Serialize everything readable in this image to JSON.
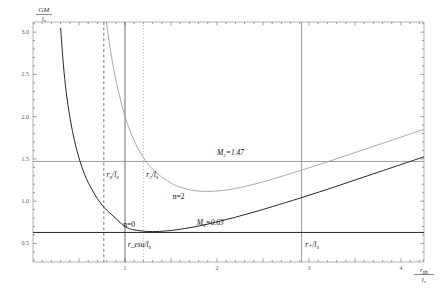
{
  "chart_data": {
    "type": "line",
    "title": "",
    "xlabel": "r_ph/l_0",
    "ylabel": "GM/l_0",
    "xlim": [
      0,
      4.25
    ],
    "ylim": [
      0.28,
      3.12
    ],
    "xticks": [
      0.5,
      1,
      1.5,
      2,
      2.5,
      3,
      3.5,
      4
    ],
    "xticklabels": [
      "",
      "1",
      "",
      "2",
      "",
      "3",
      "",
      "4"
    ],
    "yticks": [
      0.5,
      1.0,
      1.5,
      2.0,
      2.5,
      3.0
    ],
    "yticklabels": [
      "0.5",
      "1.0",
      "1.5",
      "2.0",
      "2.5",
      "3.0"
    ],
    "grid": false,
    "legend_position": "inline-annotations",
    "series": [
      {
        "name": "n=0",
        "color": "#262626",
        "style": "solid",
        "label": "n=0",
        "minimum": {
          "x": 1.0,
          "y": 0.63
        },
        "points": [
          [
            0.3,
            3.05
          ],
          [
            0.33,
            2.62
          ],
          [
            0.36,
            2.3
          ],
          [
            0.4,
            2.0
          ],
          [
            0.44,
            1.77
          ],
          [
            0.48,
            1.59
          ],
          [
            0.52,
            1.44
          ],
          [
            0.56,
            1.32
          ],
          [
            0.6,
            1.22
          ],
          [
            0.65,
            1.12
          ],
          [
            0.7,
            1.03
          ],
          [
            0.75,
            0.955
          ],
          [
            0.8,
            0.895
          ],
          [
            0.85,
            0.845
          ],
          [
            0.9,
            0.795
          ],
          [
            0.95,
            0.745
          ],
          [
            1.0,
            0.7
          ],
          [
            1.05,
            0.675
          ],
          [
            1.1,
            0.66
          ],
          [
            1.2,
            0.645
          ],
          [
            1.3,
            0.64
          ],
          [
            1.45,
            0.648
          ],
          [
            1.6,
            0.668
          ],
          [
            1.8,
            0.705
          ],
          [
            2.0,
            0.755
          ],
          [
            2.2,
            0.81
          ],
          [
            2.4,
            0.87
          ],
          [
            2.6,
            0.935
          ],
          [
            2.9,
            1.035
          ],
          [
            3.2,
            1.14
          ],
          [
            3.5,
            1.25
          ],
          [
            3.8,
            1.36
          ],
          [
            4.1,
            1.47
          ],
          [
            4.25,
            1.525
          ]
        ]
      },
      {
        "name": "n=2",
        "color": "#9a9a9a",
        "style": "solid",
        "label": "n=2",
        "minimum": {
          "x": 1.75,
          "y": 1.11
        },
        "points": [
          [
            0.8,
            3.1
          ],
          [
            0.84,
            2.8
          ],
          [
            0.88,
            2.55
          ],
          [
            0.92,
            2.34
          ],
          [
            0.96,
            2.16
          ],
          [
            1.0,
            2.0
          ],
          [
            1.05,
            1.845
          ],
          [
            1.1,
            1.715
          ],
          [
            1.15,
            1.605
          ],
          [
            1.2,
            1.515
          ],
          [
            1.25,
            1.44
          ],
          [
            1.3,
            1.38
          ],
          [
            1.4,
            1.285
          ],
          [
            1.5,
            1.215
          ],
          [
            1.6,
            1.165
          ],
          [
            1.75,
            1.125
          ],
          [
            1.9,
            1.115
          ],
          [
            2.05,
            1.125
          ],
          [
            2.2,
            1.15
          ],
          [
            2.4,
            1.2
          ],
          [
            2.6,
            1.26
          ],
          [
            2.9,
            1.36
          ],
          [
            3.2,
            1.465
          ],
          [
            3.5,
            1.575
          ],
          [
            3.8,
            1.685
          ],
          [
            4.1,
            1.795
          ],
          [
            4.25,
            1.85
          ]
        ]
      }
    ],
    "horizontal_lines": [
      {
        "name": "M2",
        "y": 1.47,
        "label": "M₂=1.47",
        "color": "#8a8a8a",
        "style": "solid"
      },
      {
        "name": "M0",
        "y": 0.63,
        "label": "M₀=0.63",
        "color": "#262626",
        "style": "solid"
      }
    ],
    "vertical_lines": [
      {
        "name": "r0",
        "x": 0.77,
        "label": "r₀/l₀",
        "color": "#444444",
        "style": "dashed"
      },
      {
        "name": "r_esu",
        "x": 1.0,
        "label": "r_esu/l₀",
        "color": "#555555",
        "style": "solid"
      },
      {
        "name": "r2",
        "x": 1.2,
        "label": "r₂/l₀",
        "color": "#9a9a9a",
        "style": "dotted"
      },
      {
        "name": "r_plus",
        "x": 2.92,
        "label": "r₊/l₀",
        "color": "#8a8a8a",
        "style": "solid"
      }
    ],
    "annotations": [
      {
        "name": "label-M2",
        "text": "M₂=1.47",
        "x": 2.0,
        "y": 1.55,
        "color": "#8a8a8a"
      },
      {
        "name": "label-M0",
        "text": "M₀=0.63",
        "x": 1.78,
        "y": 0.72,
        "color": "#000000"
      },
      {
        "name": "label-n0",
        "text": "n=0",
        "x": 0.98,
        "y": 0.7,
        "color": "#111111"
      },
      {
        "name": "label-n2",
        "text": "n=2",
        "x": 1.52,
        "y": 1.03,
        "color": "#8a8a8a"
      },
      {
        "name": "label-r0",
        "text": "r₀/l₀",
        "x": 0.8,
        "y": 1.29,
        "color": "#444444"
      },
      {
        "name": "label-r2",
        "text": "r₂/l₀",
        "x": 1.23,
        "y": 1.29,
        "color": "#9a9a9a"
      },
      {
        "name": "label-resu",
        "text": "r_esu/l₀",
        "x": 1.03,
        "y": 0.455,
        "color": "#111111"
      },
      {
        "name": "label-rplus",
        "text": "r₊/l₀",
        "x": 2.96,
        "y": 0.455,
        "color": "#8a8a8a"
      }
    ]
  },
  "axis": {
    "y_title_numerator": "GM",
    "y_title_denominator": "l₀",
    "x_title_numerator": "r_ph",
    "x_title_denominator": "l₀"
  }
}
